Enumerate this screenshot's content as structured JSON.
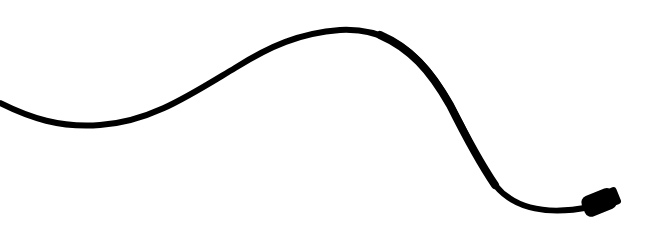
{
  "image": {
    "subject": "Black cable with connector plug on white background",
    "background_color": "#ffffff",
    "cable_color": "#000000"
  }
}
